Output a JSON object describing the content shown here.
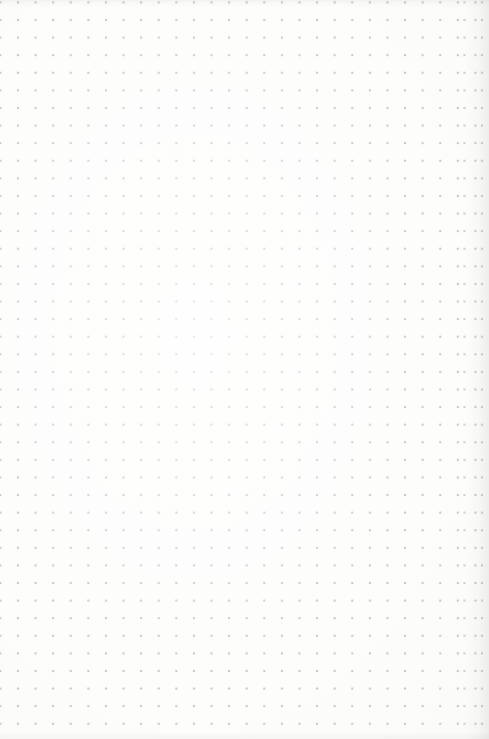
{
  "page": {
    "background_color": "#fdfdfc",
    "dot_color": "#c9c9c9",
    "edge_shadow_color": "#e9e9e9",
    "grid": {
      "spacing_px": 17.6,
      "offset_x_px": 18,
      "offset_y_px": 20,
      "columns": 27,
      "rows": 41
    }
  }
}
